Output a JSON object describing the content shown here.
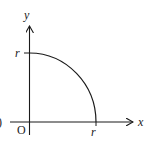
{
  "diagram": {
    "axes": {
      "x_label": "x",
      "y_label": "y",
      "origin_label": "O"
    },
    "ticks": {
      "x_tick_label": "r",
      "y_tick_label": "r"
    },
    "left_edge_fragment": ")",
    "colors": {
      "stroke": "#1a1a1a",
      "background": "#ffffff"
    }
  }
}
